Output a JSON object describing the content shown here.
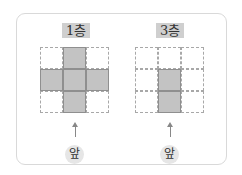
{
  "panels": [
    {
      "label": "1층",
      "grid": [
        [
          0,
          1,
          0
        ],
        [
          1,
          1,
          1
        ],
        [
          0,
          1,
          0
        ]
      ],
      "front_label": "앞"
    },
    {
      "label": "3층",
      "grid": [
        [
          0,
          0,
          0
        ],
        [
          0,
          1,
          0
        ],
        [
          0,
          1,
          0
        ]
      ],
      "front_label": "앞"
    }
  ],
  "colors": {
    "filled_cell": "#c3c3c3",
    "badge": "#cfcfcf",
    "front_circle": "#e6e6e6"
  }
}
